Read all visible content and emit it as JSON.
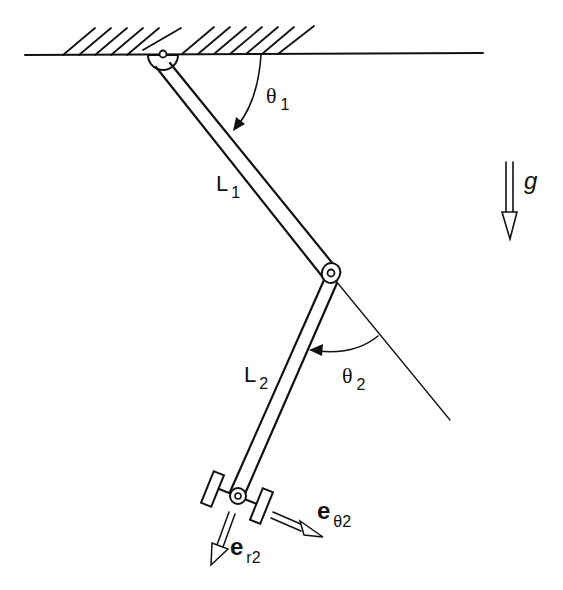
{
  "diagram": {
    "colors": {
      "ink": "#111111",
      "background": "#ffffff"
    },
    "ground": {
      "label": "fixed support (hatched ceiling)"
    },
    "links": [
      {
        "id": "L1",
        "label_main": "L",
        "label_sub": "1"
      },
      {
        "id": "L2",
        "label_main": "L",
        "label_sub": "2"
      }
    ],
    "angles": [
      {
        "id": "theta1",
        "label_main": "θ",
        "label_sub": "1"
      },
      {
        "id": "theta2",
        "label_main": "θ",
        "label_sub": "2"
      }
    ],
    "gravity": {
      "label": "g"
    },
    "unit_vectors": [
      {
        "id": "e_r2",
        "label_main": "e",
        "label_sub": "r2"
      },
      {
        "id": "e_theta2",
        "label_main": "e",
        "label_sub": "θ2"
      }
    ]
  }
}
